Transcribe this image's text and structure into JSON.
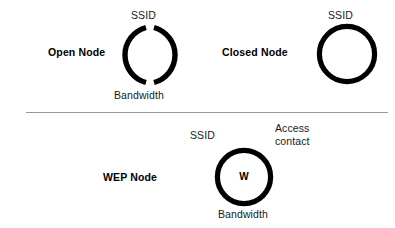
{
  "figure": {
    "background_color": "#ffffff",
    "stroke_color": "#000000",
    "divider_color": "#9a9a9a"
  },
  "sections": {
    "top": {
      "open_node": {
        "name": "Open Node",
        "glyph": "open-circle-split-arcs",
        "labels": {
          "top": "SSID",
          "bottom": "Bandwidth"
        }
      },
      "closed_node": {
        "name": "Closed Node",
        "glyph": "closed-circle-ring",
        "labels": {
          "top": "SSID"
        }
      }
    },
    "bottom": {
      "wep_node": {
        "name": "WEP Node",
        "glyph": "closed-circle-ring-with-letter",
        "inner_letter": "W",
        "labels": {
          "left": "SSID",
          "bottom": "Bandwidth",
          "right_line1": "Access",
          "right_line2": "contact"
        }
      }
    }
  }
}
